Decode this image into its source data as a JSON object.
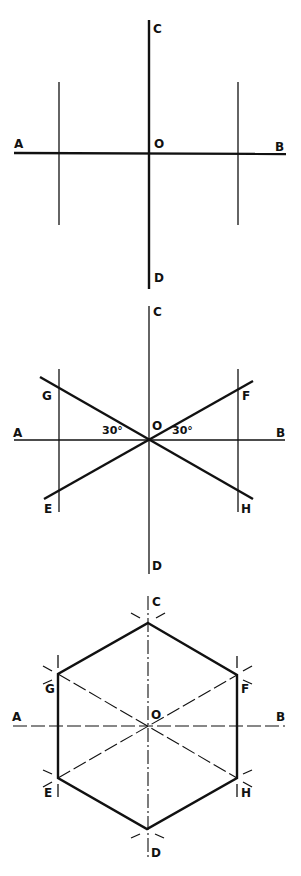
{
  "figure": {
    "stroke_color": "#111111",
    "background": "#ffffff",
    "panels": [
      {
        "id": "step-1",
        "labels": {
          "A": "A",
          "B": "B",
          "C": "C",
          "D": "D",
          "O": "O"
        }
      },
      {
        "id": "step-2",
        "labels": {
          "A": "A",
          "B": "B",
          "C": "C",
          "D": "D",
          "O": "O",
          "E": "E",
          "F": "F",
          "G": "G",
          "H": "H"
        },
        "angle_left": "30°",
        "angle_right": "30°"
      },
      {
        "id": "step-3",
        "labels": {
          "A": "A",
          "B": "B",
          "C": "C",
          "D": "D",
          "O": "O",
          "E": "E",
          "F": "F",
          "G": "G",
          "H": "H"
        }
      }
    ]
  }
}
